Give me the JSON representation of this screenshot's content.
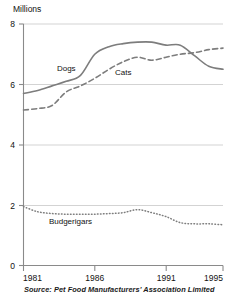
{
  "chart_data": {
    "type": "line",
    "title": "",
    "ylabel": "Millions",
    "xlabel": "",
    "source": "Source: Pet Food Manufacturers' Association Limited",
    "xlim": [
      1981,
      1995
    ],
    "ylim": [
      0,
      8
    ],
    "grid": true,
    "legend_position": "inline-labels",
    "y_ticks": [
      "8",
      "6",
      "4",
      "2",
      "0"
    ],
    "y_tick_values": [
      8,
      6,
      4,
      2,
      0
    ],
    "x_ticks": [
      "1981",
      "1986",
      "1991",
      "1995"
    ],
    "x_tick_values": [
      1981,
      1986,
      1991,
      1995
    ],
    "x": [
      1981,
      1982,
      1983,
      1984,
      1985,
      1986,
      1987,
      1988,
      1989,
      1990,
      1991,
      1992,
      1993,
      1994,
      1995
    ],
    "series": [
      {
        "name": "Dogs",
        "style": "solid",
        "color": "#7d7d7d",
        "label_x": 1984.0,
        "label_y": 6.45,
        "values": [
          5.7,
          5.8,
          5.95,
          6.1,
          6.3,
          7.0,
          7.25,
          7.35,
          7.4,
          7.4,
          7.3,
          7.3,
          6.95,
          6.6,
          6.5
        ]
      },
      {
        "name": "Cats",
        "style": "dashed",
        "color": "#7d7d7d",
        "label_x": 1988.0,
        "label_y": 6.3,
        "values": [
          5.15,
          5.2,
          5.3,
          5.75,
          5.95,
          6.2,
          6.5,
          6.75,
          6.9,
          6.8,
          6.9,
          7.0,
          7.05,
          7.15,
          7.2
        ]
      },
      {
        "name": "Budgerigars",
        "style": "dotted",
        "color": "#7d7d7d",
        "label_x": 1984.3,
        "label_y": 1.38,
        "values": [
          1.95,
          1.78,
          1.72,
          1.7,
          1.7,
          1.7,
          1.72,
          1.75,
          1.85,
          1.75,
          1.62,
          1.42,
          1.38,
          1.38,
          1.35
        ]
      }
    ]
  },
  "labels": {
    "y_axis_title": "Millions",
    "source_text": "Source: Pet Food Manufacturers' Association Limited",
    "series_dogs": "Dogs",
    "series_cats": "Cats",
    "series_budgerigars": "Budgerigars",
    "y_tick_8": "8",
    "y_tick_6": "6",
    "y_tick_4": "4",
    "y_tick_2": "2",
    "y_tick_0": "0",
    "x_tick_1981": "1981",
    "x_tick_1986": "1986",
    "x_tick_1991": "1991",
    "x_tick_1995": "1995"
  }
}
